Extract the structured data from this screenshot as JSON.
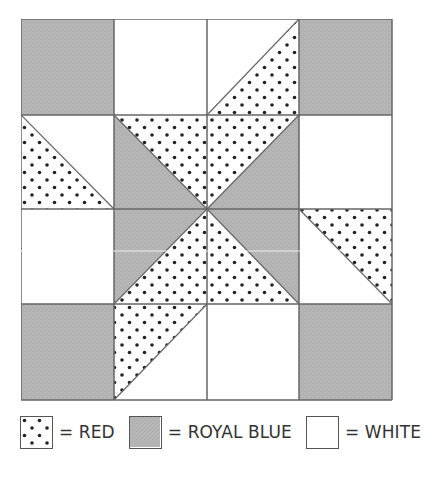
{
  "diagram": {
    "type": "quilt-block",
    "grid": {
      "rows": 4,
      "cols": 4
    },
    "colors": {
      "red_pattern": {
        "fill": "#ffffff",
        "dot": "#222222"
      },
      "royal_blue_pattern": "#b3b3b3",
      "white": "#ffffff",
      "line": "#666666"
    },
    "cells": [
      [
        {
          "type": "solid",
          "fill": "blue"
        },
        {
          "type": "solid",
          "fill": "white"
        },
        {
          "type": "hst",
          "diag": "bl-tr",
          "a": "white",
          "b": "red"
        },
        {
          "type": "solid",
          "fill": "blue"
        }
      ],
      [
        {
          "type": "hst",
          "diag": "tl-br",
          "a": "red",
          "b": "white"
        },
        {
          "type": "hst",
          "diag": "tl-br",
          "a": "blue",
          "b": "red"
        },
        {
          "type": "hst",
          "diag": "bl-tr",
          "a": "red",
          "b": "blue"
        },
        {
          "type": "solid",
          "fill": "white"
        }
      ],
      [
        {
          "type": "solid",
          "fill": "white"
        },
        {
          "type": "hst",
          "diag": "bl-tr",
          "a": "blue",
          "b": "red"
        },
        {
          "type": "hst",
          "diag": "tl-br",
          "a": "red",
          "b": "blue"
        },
        {
          "type": "hst",
          "diag": "tl-br",
          "a": "white",
          "b": "red"
        }
      ],
      [
        {
          "type": "solid",
          "fill": "blue"
        },
        {
          "type": "hst",
          "diag": "bl-tr",
          "a": "red",
          "b": "white"
        },
        {
          "type": "solid",
          "fill": "white"
        },
        {
          "type": "solid",
          "fill": "blue"
        }
      ]
    ]
  },
  "legend": [
    {
      "key": "red",
      "label": "= RED"
    },
    {
      "key": "blue",
      "label": "= ROYAL BLUE"
    },
    {
      "key": "white",
      "label": "= WHITE"
    }
  ]
}
